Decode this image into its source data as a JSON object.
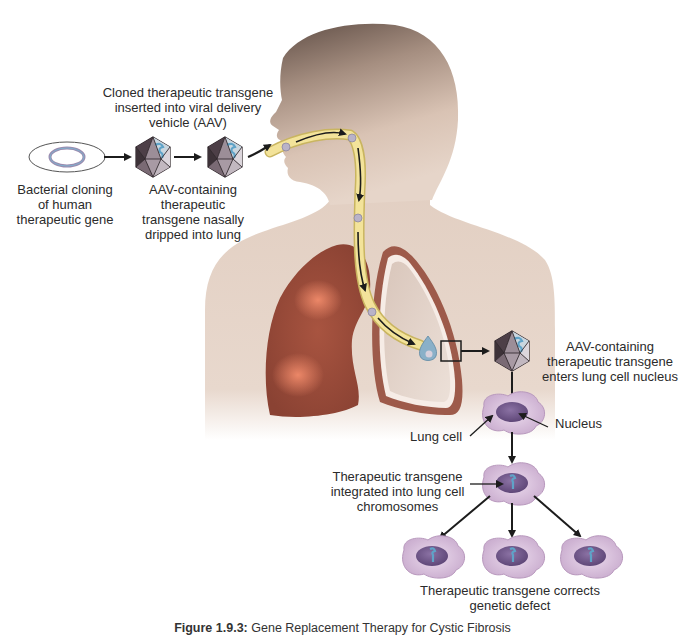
{
  "figure": {
    "caption_label": "Figure 1.9.3:",
    "caption_text": "Gene Replacement Therapy for Cystic Fibrosis"
  },
  "labels": {
    "cloned_transgene": [
      "Cloned therapeutic transgene",
      "inserted into viral delivery",
      "vehicle (AAV)"
    ],
    "bacterial_cloning": [
      "Bacterial cloning",
      "of human",
      "therapeutic gene"
    ],
    "aav_nasal": [
      "AAV-containing",
      "therapeutic",
      "transgene nasally",
      "dripped into lung"
    ],
    "aav_enters": [
      "AAV-containing",
      "therapeutic transgene",
      "enters lung cell nucleus"
    ],
    "lung_cell": "Lung cell",
    "nucleus": "Nucleus",
    "integrated": [
      "Therapeutic transgene",
      "integrated into lung cell",
      "chromosomes"
    ],
    "corrects": [
      "Therapeutic transgene corrects",
      "genetic defect"
    ]
  },
  "colors": {
    "skin_light": "#e9d8cc",
    "skin_dark": "#6e5a4f",
    "lung_diseased": "#9a4a38",
    "lung_highlight": "#e8765a",
    "airway_yellow": "#f3e39a",
    "cell_fill": "#d9c2dc",
    "nucleus_fill": "#7d6295",
    "virus_dark": "#4d3f47",
    "virus_mid": "#8e7e88",
    "virus_light": "#c9bfc6",
    "transgene_blue": "#5fa3c8",
    "arrow": "#1c1c1c"
  }
}
